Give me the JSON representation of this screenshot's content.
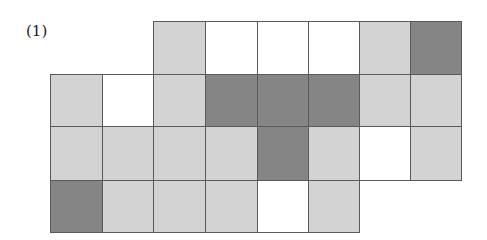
{
  "figure": {
    "label": "(1)",
    "colors": {
      "light": "#d3d3d3",
      "white": "#ffffff",
      "dark": "#858585",
      "border": "#5a5a5a"
    },
    "col_x": [
      50,
      102,
      153,
      205,
      257,
      308,
      359,
      410,
      461
    ],
    "row_y": [
      21,
      74,
      126,
      180,
      232
    ],
    "rows": [
      {
        "start_col": 2,
        "cells": [
          "light",
          "white",
          "white",
          "white",
          "light",
          "dark"
        ]
      },
      {
        "start_col": 0,
        "cells": [
          "light",
          "white",
          "light",
          "dark",
          "dark",
          "dark",
          "light",
          "light"
        ]
      },
      {
        "start_col": 0,
        "cells": [
          "light",
          "light",
          "light",
          "light",
          "dark",
          "light",
          "white",
          "light"
        ]
      },
      {
        "start_col": 0,
        "cells": [
          "dark",
          "light",
          "light",
          "light",
          "white",
          "light"
        ]
      }
    ]
  }
}
